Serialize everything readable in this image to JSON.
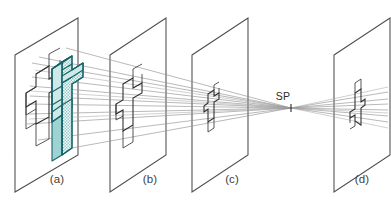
{
  "figure": {
    "background_color": "#ffffff",
    "line_color": "#4c4c4c",
    "ray_color": "#8d8d8d",
    "object_color": "#2b2b2b",
    "accent_color": "#14656b",
    "accent_fill_color": "#cfe9e8",
    "top_strip_text": "",
    "station_point": {
      "label": "SP",
      "x": 289,
      "y": 101,
      "tick_x": 291,
      "tick_y_top": 104,
      "tick_y_bottom": 112
    },
    "planes": [
      {
        "id": "a",
        "label": "(a)",
        "label_x": 57,
        "label_y": 183,
        "near_edge_x": 15,
        "far_edge_x": 78,
        "top_far_y": 18,
        "bottom_far_y": 155,
        "top_near_y": 55,
        "bottom_near_y": 192,
        "description": "Picture plane carrying the three-dimensional object"
      },
      {
        "id": "b",
        "label": "(b)",
        "label_x": 150,
        "label_y": 183,
        "near_edge_x": 110,
        "far_edge_x": 166,
        "top_far_y": 18,
        "bottom_far_y": 155,
        "top_near_y": 55,
        "bottom_near_y": 192,
        "description": "First intermediate picture plane with reduced projected outline"
      },
      {
        "id": "c",
        "label": "(c)",
        "label_x": 232,
        "label_y": 183,
        "near_edge_x": 192,
        "far_edge_x": 248,
        "top_far_y": 18,
        "bottom_far_y": 155,
        "top_near_y": 55,
        "bottom_near_y": 192,
        "description": "Second intermediate picture plane, outline further reduced"
      },
      {
        "id": "d",
        "label": "(d)",
        "label_x": 362,
        "label_y": 183,
        "near_edge_x": 334,
        "far_edge_x": 390,
        "top_far_y": 18,
        "bottom_far_y": 155,
        "top_near_y": 55,
        "bottom_near_y": 192,
        "description": "Picture plane beyond the station point showing the inverted image"
      }
    ],
    "object": {
      "name": "extruded-arrow-solid",
      "fill_pattern": "checkered",
      "outline_color": "#14656b",
      "located_on_plane": "a"
    },
    "projections": [
      {
        "plane": "b",
        "scale": "medium",
        "orientation": "upright"
      },
      {
        "plane": "c",
        "scale": "small",
        "orientation": "upright"
      },
      {
        "plane": "d",
        "scale": "small",
        "orientation": "inverted"
      }
    ],
    "ray_count": 9
  }
}
